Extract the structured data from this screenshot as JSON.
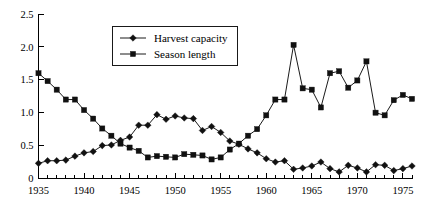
{
  "chart_data": {
    "type": "line",
    "title": "",
    "subtitle": "",
    "xlabel": "",
    "ylabel": "",
    "xlim": [
      1935,
      1976
    ],
    "ylim": [
      0,
      2.5
    ],
    "grid": false,
    "legend_position": "top-center",
    "x_tick_labels": [
      "1935",
      "1940",
      "1945",
      "1950",
      "1955",
      "1960",
      "1965",
      "1970",
      "1975"
    ],
    "x_tick_values": [
      1935,
      1940,
      1945,
      1950,
      1955,
      1960,
      1965,
      1970,
      1975
    ],
    "x_minor_tick_step": 1,
    "y_tick_labels": [
      "0",
      "0.5",
      "1.0",
      "1.5",
      "2.0",
      "2.5"
    ],
    "y_tick_values": [
      0,
      0.5,
      1.0,
      1.5,
      2.0,
      2.5
    ],
    "x": [
      1935,
      1936,
      1937,
      1938,
      1939,
      1940,
      1941,
      1942,
      1943,
      1944,
      1945,
      1946,
      1947,
      1948,
      1949,
      1950,
      1951,
      1952,
      1953,
      1954,
      1955,
      1956,
      1957,
      1958,
      1959,
      1960,
      1961,
      1962,
      1963,
      1964,
      1965,
      1966,
      1967,
      1968,
      1969,
      1970,
      1971,
      1972,
      1973,
      1974,
      1975,
      1976
    ],
    "series": [
      {
        "name": "Harvest capacity",
        "marker": "diamond",
        "color": "#111111",
        "values": [
          0.23,
          0.27,
          0.27,
          0.28,
          0.34,
          0.39,
          0.41,
          0.5,
          0.51,
          0.58,
          0.63,
          0.81,
          0.81,
          0.97,
          0.9,
          0.95,
          0.92,
          0.91,
          0.73,
          0.79,
          0.7,
          0.57,
          0.52,
          0.45,
          0.39,
          0.3,
          0.25,
          0.27,
          0.14,
          0.16,
          0.19,
          0.25,
          0.15,
          0.1,
          0.2,
          0.16,
          0.1,
          0.21,
          0.2,
          0.12,
          0.15,
          0.19
        ]
      },
      {
        "name": "Season length",
        "marker": "square",
        "color": "#111111",
        "values": [
          1.6,
          1.48,
          1.35,
          1.2,
          1.2,
          1.04,
          0.91,
          0.76,
          0.65,
          0.53,
          0.47,
          0.42,
          0.32,
          0.34,
          0.33,
          0.32,
          0.37,
          0.36,
          0.35,
          0.29,
          0.32,
          0.44,
          0.53,
          0.65,
          0.75,
          0.96,
          1.2,
          1.2,
          2.03,
          1.37,
          1.35,
          1.08,
          1.6,
          1.63,
          1.38,
          1.49,
          1.78,
          1.0,
          0.96,
          1.19,
          1.27,
          1.21
        ]
      }
    ],
    "legend": [
      {
        "label": "Harvest capacity",
        "marker": "diamond"
      },
      {
        "label": "Season length",
        "marker": "square"
      }
    ]
  }
}
